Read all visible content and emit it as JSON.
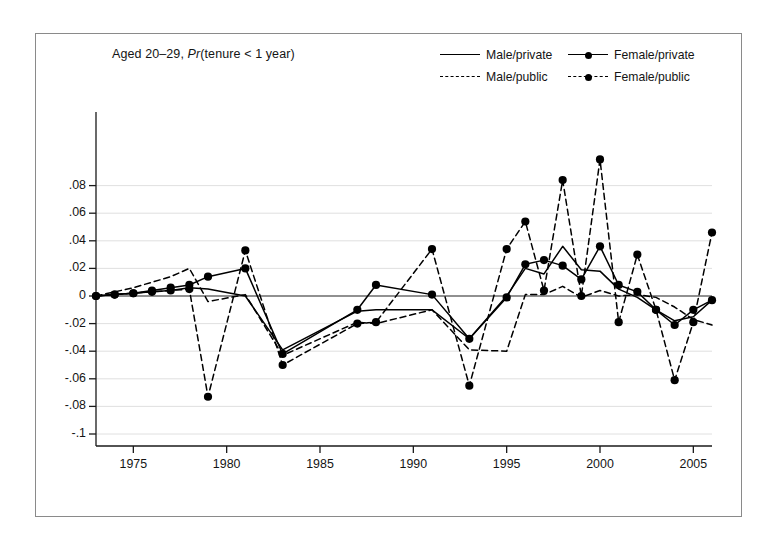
{
  "figure": {
    "title_main": "Aged 20–29, ",
    "title_italic": "Pr",
    "title_rest": "(tenure < 1 year)",
    "background": "#ffffff",
    "frame_color": "#8a8a8a",
    "line_color": "#000000"
  },
  "legend": {
    "position": "top-right",
    "entries": [
      {
        "label": "Male/private",
        "style": "solid",
        "marker": "none"
      },
      {
        "label": "Female/private",
        "style": "solid",
        "marker": "circle"
      },
      {
        "label": "Male/public",
        "style": "dashed",
        "marker": "none"
      },
      {
        "label": "Female/public",
        "style": "dashed",
        "marker": "circle"
      }
    ]
  },
  "chart_data": {
    "type": "line",
    "title": "Aged 20–29, Pr(tenure < 1 year)",
    "xlabel": "",
    "ylabel": "",
    "xlim": [
      1973,
      2006
    ],
    "ylim": [
      -0.1,
      0.095
    ],
    "grid": true,
    "xticks": [
      1975,
      1980,
      1985,
      1990,
      1995,
      2000,
      2005
    ],
    "xtick_labels": [
      "1975",
      "1980",
      "1985",
      "1990",
      "1995",
      "2000",
      "2005"
    ],
    "yticks": [
      0.08,
      0.06,
      0.04,
      0.02,
      0,
      -0.02,
      -0.04,
      -0.06,
      -0.08,
      -0.1
    ],
    "ytick_labels": [
      ".08",
      ".06",
      ".04",
      ".02",
      "0",
      "-.02",
      "-.04",
      "-.06",
      "-.08",
      "-.1"
    ],
    "zero_line": 0,
    "x": [
      1973,
      1974,
      1975,
      1976,
      1977,
      1978,
      1979,
      1981,
      1983,
      1987,
      1988,
      1991,
      1993,
      1995,
      1996,
      1997,
      1998,
      1999,
      2000,
      2001,
      2002,
      2003,
      2004,
      2005,
      2006
    ],
    "series": [
      {
        "name": "Male/private",
        "style": "solid",
        "marker": "none",
        "x": [
          1973,
          1974,
          1975,
          1976,
          1977,
          1978,
          1979,
          1981,
          1983,
          1987,
          1988,
          1991,
          1993,
          1995,
          1996,
          1997,
          1998,
          1999,
          2000,
          2001,
          2002,
          2003,
          2004,
          2005,
          2006
        ],
        "values": [
          0.0,
          0.001,
          0.002,
          0.003,
          0.004,
          0.006,
          0.005,
          0.0,
          -0.039,
          -0.011,
          -0.01,
          -0.01,
          -0.031,
          0.0,
          0.02,
          0.016,
          0.036,
          0.019,
          0.018,
          0.005,
          -0.001,
          -0.01,
          -0.018,
          -0.015,
          -0.003
        ]
      },
      {
        "name": "Female/private",
        "style": "solid",
        "marker": "circle",
        "x": [
          1973,
          1974,
          1975,
          1976,
          1977,
          1978,
          1979,
          1981,
          1983,
          1987,
          1988,
          1991,
          1993,
          1995,
          1996,
          1997,
          1998,
          1999,
          2000,
          2001,
          2002,
          2003,
          2004,
          2005,
          2006
        ],
        "values": [
          0.0,
          0.001,
          0.002,
          0.004,
          0.006,
          0.008,
          0.014,
          0.02,
          -0.042,
          -0.01,
          0.008,
          0.001,
          -0.031,
          -0.001,
          0.023,
          0.026,
          0.022,
          0.012,
          0.036,
          0.008,
          0.003,
          -0.01,
          -0.021,
          -0.01,
          -0.003
        ]
      },
      {
        "name": "Male/public",
        "style": "dashed",
        "marker": "none",
        "x": [
          1973,
          1974,
          1975,
          1976,
          1977,
          1978,
          1979,
          1981,
          1983,
          1987,
          1988,
          1991,
          1993,
          1995,
          1996,
          1997,
          1998,
          1999,
          2000,
          2001,
          2002,
          2003,
          2004,
          2005,
          2006
        ],
        "values": [
          0.0,
          0.003,
          0.006,
          0.01,
          0.014,
          0.02,
          -0.004,
          0.001,
          -0.043,
          -0.019,
          -0.02,
          -0.01,
          -0.039,
          -0.04,
          0.001,
          0.001,
          0.007,
          -0.001,
          0.004,
          0.0,
          0.001,
          -0.001,
          -0.008,
          -0.017,
          -0.021
        ]
      },
      {
        "name": "Female/public",
        "style": "dashed",
        "marker": "circle",
        "x": [
          1973,
          1974,
          1975,
          1976,
          1977,
          1978,
          1979,
          1981,
          1983,
          1987,
          1988,
          1991,
          1993,
          1995,
          1996,
          1997,
          1998,
          1999,
          2000,
          2001,
          2002,
          2003,
          2004,
          2005,
          2006
        ],
        "values": [
          0.0,
          0.001,
          0.002,
          0.003,
          0.004,
          0.005,
          -0.073,
          0.033,
          -0.05,
          -0.02,
          -0.019,
          0.034,
          -0.065,
          0.034,
          0.054,
          0.004,
          0.084,
          0.0,
          0.099,
          -0.019,
          0.03,
          -0.01,
          -0.061,
          -0.019,
          0.046
        ]
      }
    ]
  },
  "geometry": {
    "plot_left": 96,
    "plot_right": 712,
    "x_min_year": 1973,
    "x_max_year": 2006,
    "y_zero_px": 296,
    "y_px_per_unit": 1380,
    "y_top_px": 112,
    "y_bottom_px": 446
  }
}
